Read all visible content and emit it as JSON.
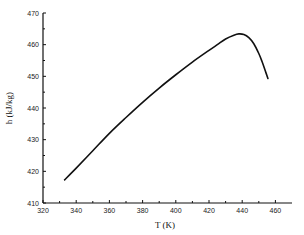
{
  "chart_data": {
    "type": "line",
    "title": "",
    "xlabel": "T (K)",
    "ylabel": "h (kJ/kg)",
    "xlim": [
      320,
      470
    ],
    "ylim": [
      410,
      470
    ],
    "xticks": [
      320,
      340,
      360,
      380,
      400,
      420,
      440,
      460
    ],
    "yticks": [
      410,
      420,
      430,
      440,
      450,
      460,
      470
    ],
    "grid": false,
    "legend": null,
    "series": [
      {
        "name": "h(T)",
        "color": "#111111",
        "x": [
          333,
          340,
          350,
          360,
          370,
          380,
          390,
          400,
          410,
          420,
          425,
          430,
          435,
          438,
          441,
          444,
          447,
          450,
          452,
          454,
          455.5
        ],
        "y": [
          417.3,
          421.0,
          426.5,
          432.0,
          437.0,
          441.8,
          446.3,
          450.5,
          454.5,
          458.2,
          460.0,
          461.8,
          463.0,
          463.4,
          463.2,
          462.2,
          460.3,
          457.2,
          454.6,
          451.6,
          449.3
        ]
      }
    ]
  }
}
